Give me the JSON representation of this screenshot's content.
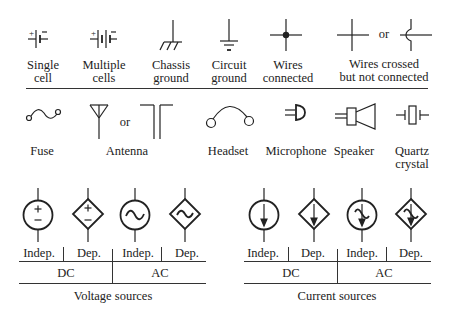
{
  "row1": {
    "single_cell": "Single\ncell",
    "single_cell_l1": "Single",
    "single_cell_l2": "cell",
    "multiple_cells_l1": "Multiple",
    "multiple_cells_l2": "cells",
    "chassis_ground_l1": "Chassis",
    "chassis_ground_l2": "ground",
    "circuit_ground_l1": "Circuit",
    "circuit_ground_l2": "ground",
    "wires_connected_l1": "Wires",
    "wires_connected_l2": "connected",
    "wires_crossed_l1": "Wires crossed",
    "wires_crossed_l2": "but not connected",
    "or": "or",
    "plus": "+",
    "minus": "−"
  },
  "row2": {
    "fuse": "Fuse",
    "antenna": "Antenna",
    "or": "or",
    "headset": "Headset",
    "microphone": "Microphone",
    "speaker": "Speaker",
    "quartz_l1": "Quartz",
    "quartz_l2": "crystal"
  },
  "voltage_sources": {
    "caption": "Voltage sources",
    "sub_labels": [
      "Indep.",
      "Dep.",
      "Indep.",
      "Dep."
    ],
    "groups": [
      "DC",
      "AC"
    ],
    "plus": "+",
    "minus": "−"
  },
  "current_sources": {
    "caption": "Current sources",
    "sub_labels": [
      "Indep.",
      "Dep.",
      "Indep.",
      "Dep."
    ],
    "groups": [
      "DC",
      "AC"
    ]
  }
}
